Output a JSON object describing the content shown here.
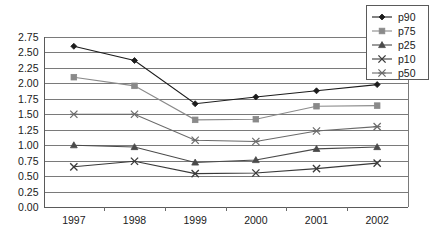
{
  "chart_data": {
    "type": "line",
    "title": "",
    "xlabel": "",
    "ylabel": "",
    "categories": [
      "1997",
      "1998",
      "1999",
      "2000",
      "2001",
      "2002"
    ],
    "ylim": [
      0.0,
      2.75
    ],
    "ytick_step": 0.25,
    "ytick_labels": [
      "0.00",
      "0.25",
      "0.50",
      "0.75",
      "1.00",
      "1.25",
      "1.50",
      "1.75",
      "2.00",
      "2.25",
      "2.50",
      "2.75"
    ],
    "grid": true,
    "legend_position": "top-right",
    "series": [
      {
        "name": "p90",
        "marker": "diamond",
        "color": "#1c1c1c",
        "values": [
          2.6,
          2.37,
          1.67,
          1.78,
          1.88,
          1.98
        ]
      },
      {
        "name": "p75",
        "marker": "square",
        "color": "#8a8a8a",
        "values": [
          2.1,
          1.96,
          1.41,
          1.42,
          1.63,
          1.64
        ]
      },
      {
        "name": "p25",
        "marker": "triangle",
        "color": "#4a4a4a",
        "values": [
          1.0,
          0.97,
          0.72,
          0.76,
          0.94,
          0.97
        ]
      },
      {
        "name": "p10",
        "marker": "cross",
        "color": "#3a3a3a",
        "values": [
          0.65,
          0.74,
          0.54,
          0.55,
          0.62,
          0.71
        ]
      },
      {
        "name": "p50",
        "marker": "asterisk",
        "color": "#6a6a6a",
        "values": [
          1.5,
          1.5,
          1.08,
          1.06,
          1.23,
          1.3
        ]
      }
    ]
  },
  "legend": {
    "items": [
      {
        "label": "p90"
      },
      {
        "label": "p75"
      },
      {
        "label": "p25"
      },
      {
        "label": "p10"
      },
      {
        "label": "p50"
      }
    ]
  }
}
